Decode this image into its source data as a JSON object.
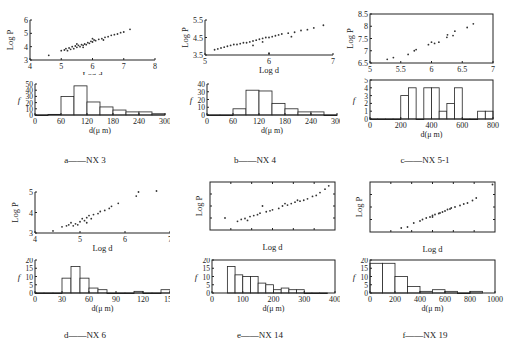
{
  "figure": {
    "panels": [
      {
        "id": "a",
        "caption": "a——NX 3"
      },
      {
        "id": "b",
        "caption": "b——NX 4"
      },
      {
        "id": "c",
        "caption": "c——NX 5-1"
      },
      {
        "id": "d",
        "caption": "d——NX 6"
      },
      {
        "id": "e",
        "caption": "e——NX 14"
      },
      {
        "id": "f",
        "caption": "f——NX 19"
      }
    ]
  },
  "chart_data": [
    {
      "panel": "a",
      "type": "scatter",
      "title": "NX 3",
      "xlabel": "Log d",
      "ylabel": "Log P",
      "xlim": [
        4,
        8
      ],
      "ylim": [
        3,
        6
      ],
      "xticks": [
        4,
        5,
        6,
        7,
        8
      ],
      "yticks": [
        3,
        4,
        5,
        6
      ],
      "frame": "open",
      "points": [
        [
          4.6,
          3.35
        ],
        [
          5.0,
          3.7
        ],
        [
          5.1,
          3.75
        ],
        [
          5.15,
          3.85
        ],
        [
          5.2,
          3.7
        ],
        [
          5.25,
          3.9
        ],
        [
          5.3,
          3.8
        ],
        [
          5.35,
          4.0
        ],
        [
          5.4,
          3.85
        ],
        [
          5.45,
          4.05
        ],
        [
          5.5,
          3.95
        ],
        [
          5.55,
          4.1
        ],
        [
          5.6,
          4.0
        ],
        [
          5.65,
          4.15
        ],
        [
          5.7,
          4.1
        ],
        [
          5.75,
          4.2
        ],
        [
          5.8,
          4.15
        ],
        [
          5.85,
          4.3
        ],
        [
          5.9,
          4.25
        ],
        [
          5.95,
          4.4
        ],
        [
          6.0,
          4.35
        ],
        [
          6.05,
          4.5
        ],
        [
          6.1,
          4.45
        ],
        [
          6.2,
          4.55
        ],
        [
          6.3,
          4.6
        ],
        [
          6.4,
          4.7
        ],
        [
          6.5,
          4.75
        ],
        [
          6.6,
          4.85
        ],
        [
          6.7,
          4.9
        ],
        [
          6.8,
          4.95
        ],
        [
          6.9,
          5.05
        ],
        [
          7.0,
          5.1
        ],
        [
          7.2,
          5.3
        ],
        [
          5.5,
          4.2
        ],
        [
          5.7,
          3.95
        ],
        [
          6.0,
          4.6
        ],
        [
          6.35,
          4.5
        ]
      ]
    },
    {
      "panel": "a",
      "type": "bar",
      "title": "NX 3",
      "xlabel": "d(μ m)",
      "ylabel": "f",
      "xlim": [
        0,
        300
      ],
      "ylim": [
        0,
        50
      ],
      "xticks": [
        0,
        60,
        120,
        180,
        240,
        300
      ],
      "yticks": [
        0,
        10,
        20,
        30,
        40,
        50
      ],
      "bin_width": 30,
      "bins": [
        0,
        30,
        60,
        90,
        120,
        150,
        180,
        210,
        240,
        270
      ],
      "values": [
        0,
        1,
        30,
        47,
        21,
        13,
        8,
        5,
        5,
        2
      ]
    },
    {
      "panel": "b",
      "type": "scatter",
      "title": "NX 4",
      "xlabel": "Log d",
      "ylabel": "Log P",
      "xlim": [
        5,
        7
      ],
      "ylim": [
        3.5,
        5.5
      ],
      "xticks": [
        5,
        6,
        7
      ],
      "yticks": [
        3.5,
        4.5,
        5.5
      ],
      "frame": "open",
      "points": [
        [
          5.15,
          3.8
        ],
        [
          5.2,
          3.85
        ],
        [
          5.25,
          3.9
        ],
        [
          5.3,
          3.95
        ],
        [
          5.35,
          4.0
        ],
        [
          5.4,
          4.05
        ],
        [
          5.45,
          4.1
        ],
        [
          5.5,
          4.1
        ],
        [
          5.55,
          4.15
        ],
        [
          5.6,
          4.2
        ],
        [
          5.65,
          4.2
        ],
        [
          5.7,
          4.25
        ],
        [
          5.75,
          4.3
        ],
        [
          5.8,
          4.35
        ],
        [
          5.85,
          4.4
        ],
        [
          5.9,
          4.45
        ],
        [
          5.95,
          4.5
        ],
        [
          6.0,
          4.5
        ],
        [
          6.05,
          4.55
        ],
        [
          6.1,
          4.6
        ],
        [
          6.15,
          4.65
        ],
        [
          6.2,
          4.7
        ],
        [
          6.3,
          4.75
        ],
        [
          6.4,
          4.8
        ],
        [
          6.5,
          4.9
        ],
        [
          6.6,
          4.95
        ],
        [
          6.7,
          5.05
        ],
        [
          6.85,
          5.2
        ],
        [
          5.75,
          4.05
        ],
        [
          6.35,
          4.55
        ],
        [
          6.0,
          3.6
        ],
        [
          5.9,
          4.25
        ]
      ]
    },
    {
      "panel": "b",
      "type": "bar",
      "title": "NX 4",
      "xlabel": "d(μ m)",
      "ylabel": "f",
      "xlim": [
        0,
        300
      ],
      "ylim": [
        0,
        40
      ],
      "xticks": [
        0,
        60,
        120,
        180,
        240,
        300
      ],
      "yticks": [
        0,
        10,
        20,
        30,
        40
      ],
      "bin_width": 30,
      "bins": [
        0,
        30,
        60,
        90,
        120,
        150,
        180,
        210,
        240,
        270
      ],
      "values": [
        0,
        0,
        8,
        32,
        31,
        15,
        8,
        4,
        4,
        0
      ]
    },
    {
      "panel": "c",
      "type": "scatter",
      "title": "NX 5-1",
      "xlabel": "Log d",
      "ylabel": "Log P",
      "xlim": [
        5,
        7
      ],
      "ylim": [
        6.5,
        8.5
      ],
      "xticks": [
        5,
        5.5,
        6,
        6.5,
        7
      ],
      "yticks": [
        6.5,
        7,
        7.5,
        8,
        8.5
      ],
      "frame": "box",
      "points": [
        [
          5.28,
          6.65
        ],
        [
          5.38,
          6.72
        ],
        [
          5.62,
          6.85
        ],
        [
          5.72,
          7.0
        ],
        [
          5.75,
          7.05
        ],
        [
          5.95,
          7.25
        ],
        [
          6.0,
          7.35
        ],
        [
          6.05,
          7.3
        ],
        [
          6.12,
          7.35
        ],
        [
          6.25,
          7.55
        ],
        [
          6.26,
          7.65
        ],
        [
          6.35,
          7.62
        ],
        [
          6.38,
          7.8
        ],
        [
          6.58,
          7.95
        ],
        [
          6.68,
          8.1
        ]
      ]
    },
    {
      "panel": "c",
      "type": "bar",
      "title": "NX 5-1",
      "xlabel": "d(μ m)",
      "ylabel": "f",
      "xlim": [
        0,
        800
      ],
      "ylim": [
        0,
        5
      ],
      "xticks": [
        0,
        200,
        400,
        600,
        800
      ],
      "yticks": [
        0,
        1,
        2,
        3,
        4,
        5
      ],
      "bin_width": 50,
      "bins": [
        0,
        50,
        100,
        150,
        200,
        250,
        300,
        350,
        400,
        450,
        500,
        550,
        600,
        650,
        700,
        750
      ],
      "values": [
        0,
        0,
        0,
        0,
        3,
        4,
        0,
        4,
        4,
        1,
        2,
        4,
        0,
        0,
        1,
        1
      ]
    },
    {
      "panel": "d",
      "type": "scatter",
      "title": "NX 6",
      "xlabel": "Log d",
      "ylabel": "Log P",
      "xlim": [
        4,
        7
      ],
      "ylim": [
        3,
        5
      ],
      "xticks": [
        4,
        5,
        6,
        7
      ],
      "yticks": [
        3,
        4,
        5
      ],
      "frame": "open",
      "points": [
        [
          4.4,
          3.1
        ],
        [
          4.6,
          3.3
        ],
        [
          4.7,
          3.35
        ],
        [
          4.75,
          3.4
        ],
        [
          4.8,
          3.5
        ],
        [
          4.85,
          3.35
        ],
        [
          4.9,
          3.45
        ],
        [
          5.0,
          3.55
        ],
        [
          5.05,
          3.7
        ],
        [
          5.1,
          3.6
        ],
        [
          5.15,
          3.75
        ],
        [
          5.2,
          3.85
        ],
        [
          5.25,
          3.7
        ],
        [
          5.3,
          3.9
        ],
        [
          5.4,
          3.95
        ],
        [
          5.45,
          4.05
        ],
        [
          5.55,
          4.1
        ],
        [
          5.65,
          4.2
        ],
        [
          5.7,
          4.3
        ],
        [
          5.85,
          4.45
        ],
        [
          6.25,
          4.8
        ],
        [
          6.3,
          5.0
        ],
        [
          6.7,
          5.05
        ],
        [
          4.95,
          3.4
        ],
        [
          5.15,
          3.5
        ]
      ]
    },
    {
      "panel": "d",
      "type": "bar",
      "title": "NX 6",
      "xlabel": "d(μ m)",
      "ylabel": "f",
      "xlim": [
        0,
        150
      ],
      "ylim": [
        0,
        20
      ],
      "xticks": [
        0,
        30,
        60,
        90,
        120,
        150
      ],
      "yticks": [
        0,
        5,
        10,
        15,
        20
      ],
      "bin_width": 10,
      "bins": [
        0,
        10,
        20,
        30,
        40,
        50,
        60,
        70,
        80,
        90,
        100,
        110,
        120,
        130,
        140
      ],
      "values": [
        0,
        0,
        0,
        9,
        16,
        9,
        3,
        2,
        0,
        0,
        0,
        1,
        0,
        0,
        2
      ]
    },
    {
      "panel": "e",
      "type": "scatter",
      "title": "NX 14",
      "xlabel": "Log d",
      "ylabel": "Log P",
      "xlim": [
        0,
        1
      ],
      "ylim": [
        0,
        1
      ],
      "xticks": [],
      "yticks": [],
      "frame": "box",
      "points": [
        [
          0.12,
          0.25
        ],
        [
          0.22,
          0.18
        ],
        [
          0.25,
          0.22
        ],
        [
          0.28,
          0.24
        ],
        [
          0.32,
          0.28
        ],
        [
          0.35,
          0.3
        ],
        [
          0.38,
          0.32
        ],
        [
          0.4,
          0.35
        ],
        [
          0.42,
          0.5
        ],
        [
          0.45,
          0.38
        ],
        [
          0.5,
          0.42
        ],
        [
          0.55,
          0.45
        ],
        [
          0.58,
          0.5
        ],
        [
          0.62,
          0.52
        ],
        [
          0.65,
          0.55
        ],
        [
          0.68,
          0.58
        ],
        [
          0.72,
          0.6
        ],
        [
          0.75,
          0.62
        ],
        [
          0.78,
          0.65
        ],
        [
          0.82,
          0.7
        ],
        [
          0.85,
          0.72
        ],
        [
          0.88,
          0.78
        ],
        [
          0.92,
          0.85
        ],
        [
          0.95,
          0.92
        ],
        [
          0.3,
          0.2
        ],
        [
          0.48,
          0.4
        ],
        [
          0.6,
          0.55
        ],
        [
          0.7,
          0.62
        ]
      ]
    },
    {
      "panel": "e",
      "type": "bar",
      "title": "NX 14",
      "xlabel": "d(μ m)",
      "ylabel": "f",
      "xlim": [
        0,
        400
      ],
      "ylim": [
        0,
        20
      ],
      "xticks": [
        0,
        100,
        200,
        300,
        400
      ],
      "yticks": [
        0,
        5,
        10,
        15,
        20
      ],
      "bin_width": 25,
      "bins": [
        50,
        75,
        100,
        125,
        150,
        175,
        200,
        225,
        250,
        275,
        300,
        325,
        350
      ],
      "values": [
        16,
        11,
        10,
        10,
        6,
        5,
        2,
        3,
        2,
        2,
        0,
        0,
        0
      ]
    },
    {
      "panel": "f",
      "type": "scatter",
      "title": "NX 19",
      "xlabel": "Log d",
      "ylabel": "Log P",
      "xlim": [
        0,
        1
      ],
      "ylim": [
        0,
        1
      ],
      "xticks": [],
      "yticks": [],
      "frame": "box",
      "points": [
        [
          0.25,
          0.08
        ],
        [
          0.3,
          0.1
        ],
        [
          0.35,
          0.18
        ],
        [
          0.4,
          0.22
        ],
        [
          0.42,
          0.25
        ],
        [
          0.45,
          0.28
        ],
        [
          0.48,
          0.3
        ],
        [
          0.5,
          0.33
        ],
        [
          0.52,
          0.35
        ],
        [
          0.55,
          0.37
        ],
        [
          0.58,
          0.4
        ],
        [
          0.6,
          0.42
        ],
        [
          0.62,
          0.45
        ],
        [
          0.65,
          0.48
        ],
        [
          0.68,
          0.5
        ],
        [
          0.72,
          0.53
        ],
        [
          0.75,
          0.56
        ],
        [
          0.78,
          0.58
        ],
        [
          0.82,
          0.63
        ],
        [
          0.85,
          0.68
        ],
        [
          0.98,
          0.95
        ],
        [
          0.5,
          0.3
        ],
        [
          0.56,
          0.38
        ],
        [
          0.64,
          0.46
        ]
      ]
    },
    {
      "panel": "f",
      "type": "bar",
      "title": "NX 19",
      "xlabel": "d(μ m)",
      "ylabel": "f",
      "xlim": [
        0,
        1000
      ],
      "ylim": [
        0,
        20
      ],
      "xticks": [
        0,
        200,
        400,
        600,
        800,
        1000
      ],
      "yticks": [
        0,
        5,
        10,
        15,
        20
      ],
      "bin_width": 100,
      "bins": [
        0,
        100,
        200,
        300,
        400,
        500,
        600,
        700,
        800
      ],
      "values": [
        18,
        18,
        10,
        4,
        1,
        2,
        1,
        0,
        1
      ]
    }
  ]
}
